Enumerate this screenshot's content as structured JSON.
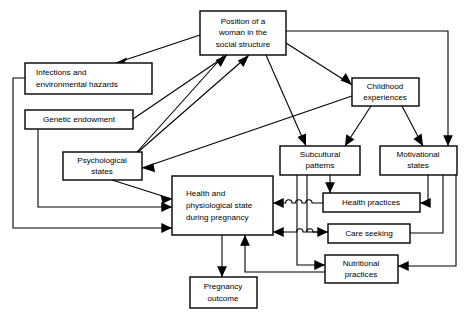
{
  "diagram": {
    "background_color": "#ffffff",
    "line_color": "#000000",
    "nodes": [
      {
        "id": "position",
        "label": "Position of a woman in the social structure",
        "lines": [
          "Position of a",
          "woman in the",
          "social structure"
        ],
        "x": 200,
        "y": 11,
        "w": 86,
        "h": 44
      },
      {
        "id": "infections",
        "label": "Infections and environmental hazards",
        "lines": [
          "Infections and",
          "environmental hazards"
        ],
        "x": 25,
        "y": 63,
        "w": 127,
        "h": 31
      },
      {
        "id": "childhood",
        "label": "Childhood experiences",
        "lines": [
          "Childhood",
          "experiences"
        ],
        "x": 352,
        "y": 78,
        "w": 67,
        "h": 28
      },
      {
        "id": "genetic",
        "label": "Genetic endowment",
        "lines": [
          "Genetic endowment"
        ],
        "x": 25,
        "y": 110,
        "w": 108,
        "h": 19
      },
      {
        "id": "subcultural",
        "label": "Subcultural patterns",
        "lines": [
          "Subcultural",
          "patterns"
        ],
        "x": 280,
        "y": 146,
        "w": 80,
        "h": 29
      },
      {
        "id": "motivational",
        "label": "Motivational states",
        "lines": [
          "Motivational",
          "states"
        ],
        "x": 380,
        "y": 146,
        "w": 77,
        "h": 29
      },
      {
        "id": "psychological",
        "label": "Psychological states",
        "lines": [
          "Psychological",
          "states"
        ],
        "x": 63,
        "y": 152,
        "w": 79,
        "h": 28
      },
      {
        "id": "health",
        "label": "Health and physiological state during pregnancy",
        "lines": [
          "Health and",
          "physiological state",
          "during pregnancy"
        ],
        "x": 172,
        "y": 176,
        "w": 101,
        "h": 59
      },
      {
        "id": "healthpractices",
        "label": "Health practices",
        "lines": [
          "Health practices"
        ],
        "x": 323,
        "y": 193,
        "w": 97,
        "h": 19
      },
      {
        "id": "careseeking",
        "label": "Care seeking",
        "lines": [
          "Care seeking"
        ],
        "x": 328,
        "y": 224,
        "w": 82,
        "h": 19
      },
      {
        "id": "nutritional",
        "label": "Nutritional practices",
        "lines": [
          "Nutritional",
          "practices"
        ],
        "x": 325,
        "y": 255,
        "w": 73,
        "h": 28
      },
      {
        "id": "pregnancy",
        "label": "Pregnancy outcome",
        "lines": [
          "Pregnancy",
          "outcome"
        ],
        "x": 190,
        "y": 277,
        "w": 67,
        "h": 31
      }
    ],
    "edges": [
      {
        "from": "position",
        "to": "infections"
      },
      {
        "from": "position",
        "to": "childhood"
      },
      {
        "from": "position",
        "to": "psychological"
      },
      {
        "from": "position",
        "to": "subcultural"
      },
      {
        "from": "position",
        "to": "motivational"
      },
      {
        "from": "genetic",
        "to": "position"
      },
      {
        "from": "psychological",
        "to": "position"
      },
      {
        "from": "childhood",
        "to": "psychological"
      },
      {
        "from": "childhood",
        "to": "subcultural"
      },
      {
        "from": "childhood",
        "to": "motivational"
      },
      {
        "from": "psychological",
        "to": "health"
      },
      {
        "from": "genetic",
        "to": "health"
      },
      {
        "from": "infections",
        "to": "health"
      },
      {
        "from": "subcultural",
        "to": "healthpractices"
      },
      {
        "from": "subcultural",
        "to": "careseeking"
      },
      {
        "from": "subcultural",
        "to": "nutritional"
      },
      {
        "from": "motivational",
        "to": "healthpractices"
      },
      {
        "from": "motivational",
        "to": "careseeking"
      },
      {
        "from": "motivational",
        "to": "nutritional"
      },
      {
        "from": "healthpractices",
        "to": "health"
      },
      {
        "from": "careseeking",
        "to": "health"
      },
      {
        "from": "nutritional",
        "to": "health"
      },
      {
        "from": "health",
        "to": "pregnancy"
      }
    ]
  }
}
